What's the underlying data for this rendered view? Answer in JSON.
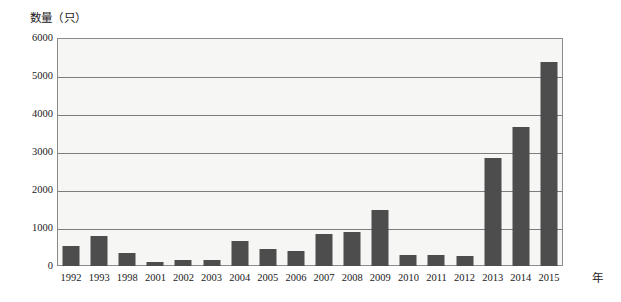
{
  "chart_data": {
    "type": "bar",
    "title": "",
    "ylabel": "数量（只）",
    "xlabel": "年",
    "categories": [
      "1992",
      "1993",
      "1998",
      "2001",
      "2002",
      "2003",
      "2004",
      "2005",
      "2006",
      "2007",
      "2008",
      "2009",
      "2010",
      "2011",
      "2012",
      "2013",
      "2014",
      "2015"
    ],
    "values": [
      520,
      800,
      330,
      100,
      150,
      170,
      660,
      440,
      400,
      840,
      900,
      1470,
      290,
      290,
      270,
      2850,
      3660,
      5370
    ],
    "ylim": [
      0,
      6000
    ],
    "yticks": [
      "0",
      "1000",
      "2000",
      "3000",
      "4000",
      "5000",
      "6000"
    ],
    "ytick_values": [
      0,
      1000,
      2000,
      3000,
      4000,
      5000,
      6000
    ],
    "grid": true,
    "legend": "none",
    "series_name": "数量",
    "bar_color": "#4d4d4d",
    "plot_background": "#f6f6f4",
    "grid_color": "#7d7d7d"
  }
}
